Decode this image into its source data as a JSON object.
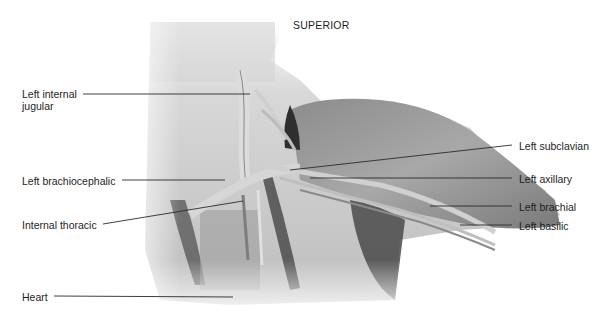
{
  "figure": {
    "orientation_label": "SUPERIOR",
    "labels_left": [
      {
        "text_line1": "Left internal",
        "text_line2": "jugular"
      },
      {
        "text": "Left brachiocephalic"
      },
      {
        "text": "Internal thoracic"
      },
      {
        "text": "Heart"
      }
    ],
    "labels_right": [
      {
        "text": "Left subclavian"
      },
      {
        "text": "Left axillary"
      },
      {
        "text": "Left brachial"
      },
      {
        "text": "Left basilic"
      }
    ],
    "colors": {
      "label_text": "#1e1e1e",
      "leader_line": "#2a2a2a",
      "background": "#ffffff"
    }
  }
}
